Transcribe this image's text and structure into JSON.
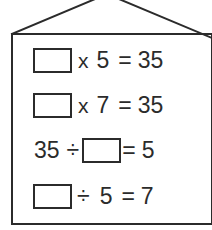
{
  "worksheet": {
    "shape": "house",
    "colors": {
      "ink": "#2b2b2b",
      "paper": "#ffffff"
    },
    "equations": [
      {
        "id": "equation-1",
        "tokens": [
          {
            "kind": "blank",
            "value": ""
          },
          {
            "kind": "operator",
            "value": "x"
          },
          {
            "kind": "number",
            "value": "5"
          },
          {
            "kind": "operator",
            "value": "="
          },
          {
            "kind": "number",
            "value": "35"
          }
        ],
        "text": "□ x 5 = 35"
      },
      {
        "id": "equation-2",
        "tokens": [
          {
            "kind": "blank",
            "value": ""
          },
          {
            "kind": "operator",
            "value": "x"
          },
          {
            "kind": "number",
            "value": "7"
          },
          {
            "kind": "operator",
            "value": "="
          },
          {
            "kind": "number",
            "value": "35"
          }
        ],
        "text": "□ x 7 = 35"
      },
      {
        "id": "equation-3",
        "tokens": [
          {
            "kind": "number",
            "value": "35"
          },
          {
            "kind": "operator",
            "value": "÷"
          },
          {
            "kind": "blank",
            "value": ""
          },
          {
            "kind": "operator",
            "value": "="
          },
          {
            "kind": "number",
            "value": "5"
          }
        ],
        "text": "35 ÷ □ = 5"
      },
      {
        "id": "equation-4",
        "tokens": [
          {
            "kind": "blank",
            "value": ""
          },
          {
            "kind": "operator",
            "value": "÷"
          },
          {
            "kind": "number",
            "value": "5"
          },
          {
            "kind": "operator",
            "value": "="
          },
          {
            "kind": "number",
            "value": "7"
          }
        ],
        "text": "□ ÷ 5 = 7"
      }
    ]
  }
}
